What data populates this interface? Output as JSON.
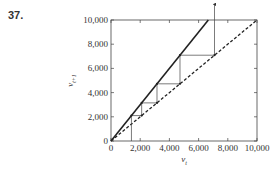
{
  "problem_number": "37.",
  "chart_data": {
    "type": "line",
    "title": "",
    "xlabel": "v_t",
    "ylabel": "v_{t+1}",
    "xlim": [
      0,
      10000
    ],
    "ylim": [
      0,
      10000
    ],
    "grid": false,
    "x_ticks": [
      0,
      2000,
      4000,
      6000,
      8000,
      10000
    ],
    "y_ticks": [
      0,
      2000,
      4000,
      6000,
      8000,
      10000
    ],
    "x_tick_labels": [
      "0",
      "2,000",
      "4,000",
      "6,000",
      "8,000",
      "10,000"
    ],
    "y_tick_labels": [
      "0",
      "2,000",
      "4,000",
      "6,000",
      "8,000",
      "10,000"
    ],
    "series": [
      {
        "name": "updating function",
        "style": "solid",
        "x": [
          0,
          6667
        ],
        "y": [
          0,
          10000
        ]
      },
      {
        "name": "diagonal v_{t+1} = v_t",
        "style": "dashed",
        "x": [
          0,
          10000
        ],
        "y": [
          0,
          10000
        ]
      },
      {
        "name": "cobweb",
        "style": "thin-solid",
        "x": [
          1400,
          1400,
          2100,
          2100,
          3150,
          3150,
          4725,
          4725,
          7090,
          7090
        ],
        "y": [
          0,
          2100,
          2100,
          3150,
          3150,
          4725,
          4725,
          7090,
          7090,
          11300
        ]
      }
    ],
    "annotations": [
      {
        "type": "arrow",
        "x": 7090,
        "direction": "up",
        "note": "trajectory exits plot upward"
      }
    ]
  }
}
